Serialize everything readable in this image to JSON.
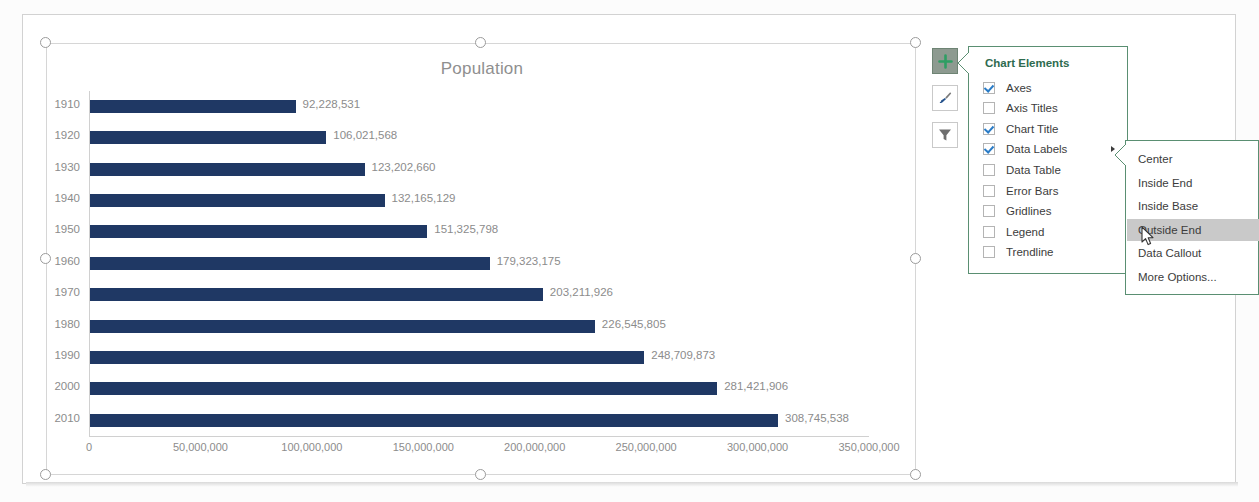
{
  "chart_data": {
    "type": "bar",
    "orientation": "horizontal",
    "title": "Population",
    "xlabel": "",
    "ylabel": "",
    "categories": [
      "1910",
      "1920",
      "1930",
      "1940",
      "1950",
      "1960",
      "1970",
      "1980",
      "1990",
      "2000",
      "2010"
    ],
    "values": [
      92228531,
      106021568,
      123202660,
      132165129,
      151325798,
      179323175,
      203211926,
      226545805,
      248709873,
      281421906,
      308745538
    ],
    "data_labels": [
      "92,228,531",
      "106,021,568",
      "123,202,660",
      "132,165,129",
      "151,325,798",
      "179,323,175",
      "203,211,926",
      "226,545,805",
      "248,709,873",
      "281,421,906",
      "308,745,538"
    ],
    "xlim": [
      0,
      350000000
    ],
    "xticks": [
      0,
      50000000,
      100000000,
      150000000,
      200000000,
      250000000,
      300000000,
      350000000
    ],
    "xtick_labels": [
      "0",
      "50,000,000",
      "100,000,000",
      "150,000,000",
      "200,000,000",
      "250,000,000",
      "300,000,000",
      "350,000,000"
    ],
    "grid": false,
    "legend": false,
    "series_color": "#1f3864",
    "data_label_position": "Outside End"
  },
  "chart_buttons": [
    {
      "name": "chart-elements-button",
      "icon": "plus-icon",
      "active": true
    },
    {
      "name": "chart-styles-button",
      "icon": "paintbrush-icon",
      "active": false
    },
    {
      "name": "chart-filters-button",
      "icon": "funnel-icon",
      "active": false
    }
  ],
  "elements_panel": {
    "title": "Chart Elements",
    "items": [
      {
        "label": "Axes",
        "checked": true,
        "has_submenu": false
      },
      {
        "label": "Axis Titles",
        "checked": false,
        "has_submenu": false
      },
      {
        "label": "Chart Title",
        "checked": true,
        "has_submenu": false
      },
      {
        "label": "Data Labels",
        "checked": true,
        "has_submenu": true
      },
      {
        "label": "Data Table",
        "checked": false,
        "has_submenu": false
      },
      {
        "label": "Error Bars",
        "checked": false,
        "has_submenu": false
      },
      {
        "label": "Gridlines",
        "checked": false,
        "has_submenu": false
      },
      {
        "label": "Legend",
        "checked": false,
        "has_submenu": false
      },
      {
        "label": "Trendline",
        "checked": false,
        "has_submenu": false
      }
    ]
  },
  "submenu": {
    "items": [
      {
        "label": "Center",
        "selected": false
      },
      {
        "label": "Inside End",
        "selected": false
      },
      {
        "label": "Inside Base",
        "selected": false
      },
      {
        "label": "Outside End",
        "selected": true
      },
      {
        "label": "Data Callout",
        "selected": false
      },
      {
        "label": "More Options...",
        "selected": false
      }
    ]
  },
  "colors": {
    "bar": "#1f3864",
    "panel_border": "#5a8f72",
    "panel_title": "#2e6b4f",
    "checkbox_check": "#2a7cc7",
    "text_gray": "#8c8c8c",
    "highlight": "#c9c9c9"
  }
}
